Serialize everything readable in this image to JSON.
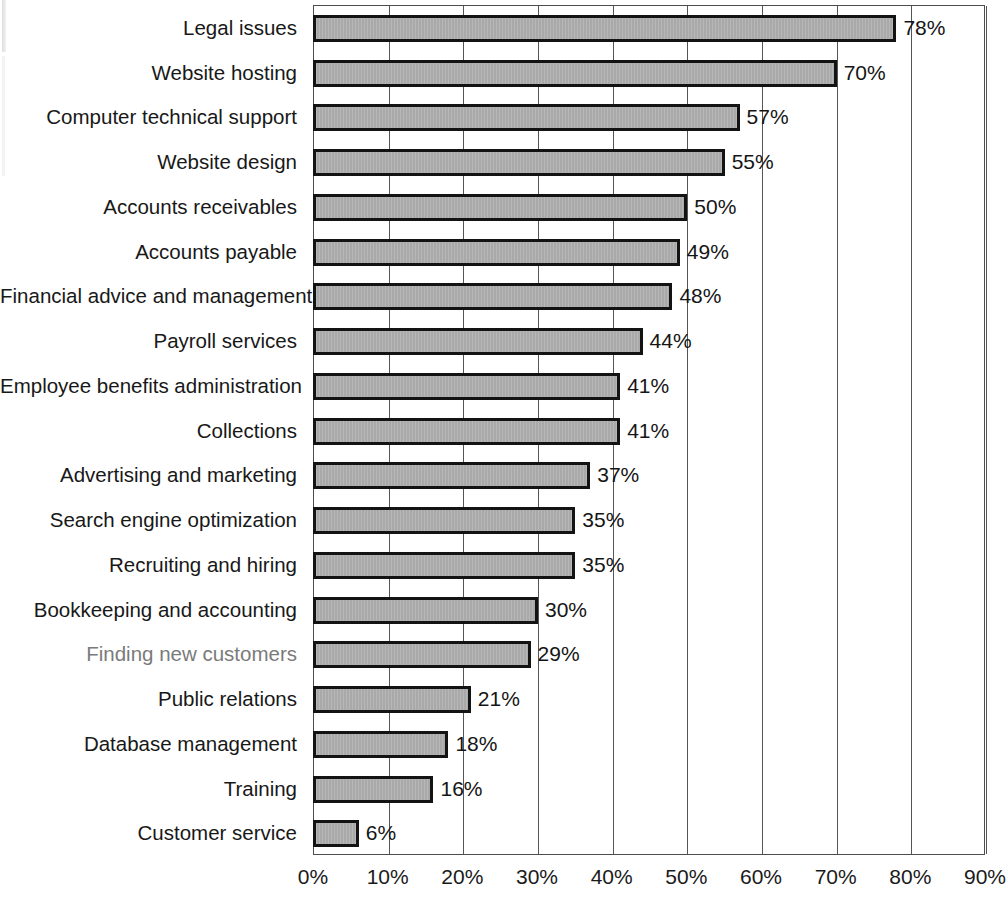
{
  "chart_data": {
    "type": "bar",
    "orientation": "horizontal",
    "title": "",
    "subtitle": "",
    "xlabel": "",
    "ylabel": "",
    "xlim": [
      0,
      90
    ],
    "x_tick_labels": [
      "0%",
      "10%",
      "20%",
      "30%",
      "40%",
      "50%",
      "60%",
      "70%",
      "80%",
      "90%"
    ],
    "x_tick_values": [
      0,
      10,
      20,
      30,
      40,
      50,
      60,
      70,
      80,
      90
    ],
    "grid": "vertical",
    "legend": null,
    "legend_position": "none",
    "value_suffix": "%",
    "categories": [
      "Legal issues",
      "Website hosting",
      "Computer technical support",
      "Website design",
      "Accounts receivables",
      "Accounts payable",
      "Financial advice and management",
      "Payroll services",
      "Employee benefits administration",
      "Collections",
      "Advertising and marketing",
      "Search engine optimization",
      "Recruiting and hiring",
      "Bookkeeping and accounting",
      "Finding new customers",
      "Public relations",
      "Database management",
      "Training",
      "Customer service"
    ],
    "values": [
      78,
      70,
      57,
      55,
      50,
      49,
      48,
      44,
      41,
      41,
      37,
      35,
      35,
      30,
      29,
      21,
      18,
      16,
      6
    ],
    "data_labels": [
      "78%",
      "70%",
      "57%",
      "55%",
      "50%",
      "49%",
      "48%",
      "44%",
      "41%",
      "41%",
      "37%",
      "35%",
      "35%",
      "30%",
      "29%",
      "21%",
      "18%",
      "16%",
      "6%"
    ],
    "bar_fill_color": "#a9a9a9",
    "bar_border_color": "#131313",
    "gridline_color": "#555555",
    "plot_border_color": "#4d4d4d",
    "background_color": "#ffffff"
  }
}
